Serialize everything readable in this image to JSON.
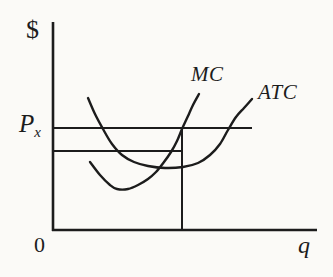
{
  "window": {
    "width": 333,
    "height": 277
  },
  "colors": {
    "ink": "#1c1c1c",
    "background": "#fbfaf7"
  },
  "labels": {
    "y_axis_unit": "$",
    "price": "P",
    "price_subscript": "x",
    "origin": "0",
    "x_axis_unit": "q",
    "mc": "MC",
    "atc": "ATC"
  },
  "chart_data": {
    "type": "line",
    "title": "",
    "xlabel": "q",
    "ylabel": "$",
    "legend": "none",
    "grid": false,
    "axes_numbered": false,
    "axes_px": {
      "origin": [
        53,
        230
      ],
      "y_axis_top": 22,
      "x_axis_right": 317
    },
    "reference_lines_px": [
      {
        "name": "price-line",
        "label": "Px",
        "from": [
          53,
          128
        ],
        "to": [
          252,
          128
        ]
      },
      {
        "name": "cost-line",
        "label": "",
        "from": [
          53,
          151
        ],
        "to": [
          183,
          151
        ]
      },
      {
        "name": "quantity-dropline",
        "label": "",
        "from": [
          182,
          129
        ],
        "to": [
          182,
          229
        ]
      }
    ],
    "series": [
      {
        "name": "MC",
        "points_px": [
          [
            90,
            162
          ],
          [
            100,
            175
          ],
          [
            110,
            185
          ],
          [
            117,
            189
          ],
          [
            128,
            189
          ],
          [
            138,
            185
          ],
          [
            148,
            179
          ],
          [
            156,
            172
          ],
          [
            164,
            162
          ],
          [
            171,
            152
          ],
          [
            177,
            141
          ],
          [
            182,
            129
          ],
          [
            188,
            116
          ],
          [
            193,
            105
          ],
          [
            199,
            94
          ]
        ]
      },
      {
        "name": "ATC",
        "points_px": [
          [
            88,
            98
          ],
          [
            95,
            114
          ],
          [
            103,
            129
          ],
          [
            112,
            144
          ],
          [
            122,
            155
          ],
          [
            134,
            162
          ],
          [
            148,
            166
          ],
          [
            165,
            168
          ],
          [
            183,
            167
          ],
          [
            198,
            163
          ],
          [
            210,
            155
          ],
          [
            220,
            144
          ],
          [
            228,
            130
          ],
          [
            236,
            117
          ],
          [
            244,
            108
          ],
          [
            252,
            99
          ]
        ]
      }
    ]
  }
}
